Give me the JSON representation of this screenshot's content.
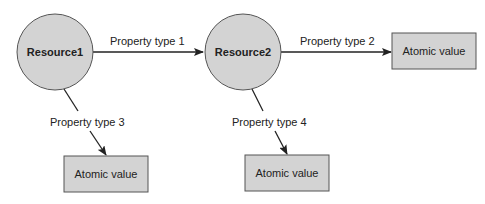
{
  "diagram": {
    "colors": {
      "node_fill": "#d3d3d3",
      "node_stroke": "#555555",
      "edge": "#222222",
      "background": "#ffffff"
    },
    "resources": [
      {
        "id": "r1",
        "label": "Resource1"
      },
      {
        "id": "r2",
        "label": "Resource2"
      }
    ],
    "atomic_values": [
      {
        "id": "a1",
        "label": "Atomic value"
      },
      {
        "id": "a2",
        "label": "Atomic value"
      },
      {
        "id": "a3",
        "label": "Atomic value"
      }
    ],
    "edges": [
      {
        "from": "r1",
        "to": "r2",
        "label": "Property type 1"
      },
      {
        "from": "r2",
        "to": "a1",
        "label": "Property type 2"
      },
      {
        "from": "r1",
        "to": "a2",
        "label": "Property type 3"
      },
      {
        "from": "r2",
        "to": "a3",
        "label": "Property type 4"
      }
    ]
  }
}
